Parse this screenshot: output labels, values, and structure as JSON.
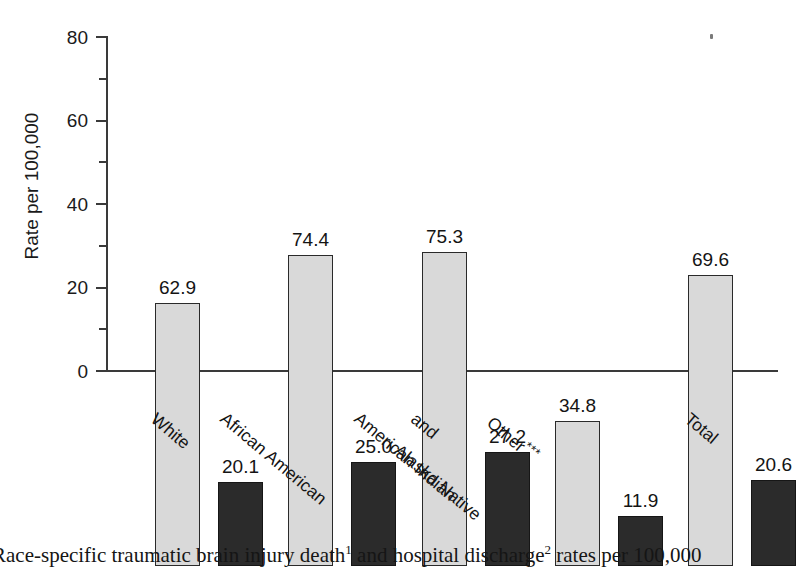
{
  "chart_data": {
    "type": "bar",
    "title": "",
    "xlabel": "",
    "ylabel": "Rate per 100,000",
    "ylim": [
      0,
      80
    ],
    "yticks": [
      0,
      20,
      40,
      60,
      80
    ],
    "yminor_ticks": [
      10,
      30,
      50,
      70
    ],
    "grid": false,
    "legend_position": "none",
    "categories": [
      "White",
      "African American",
      "American Indian\nand\nAlaska Native",
      "Other***",
      "Total"
    ],
    "category_labels": [
      {
        "line1": "White",
        "line2": "",
        "line3": "",
        "stars": ""
      },
      {
        "line1": "African American",
        "line2": "",
        "line3": "",
        "stars": ""
      },
      {
        "line1": "American Indian",
        "line2": "and",
        "line3": "Alaska Native",
        "stars": ""
      },
      {
        "line1": "Other",
        "line2": "",
        "line3": "",
        "stars": "***"
      },
      {
        "line1": "Total",
        "line2": "",
        "line3": "",
        "stars": ""
      }
    ],
    "series": [
      {
        "name": "Hospital discharge rate",
        "color": "#d9d9d9",
        "values": [
          62.9,
          74.4,
          75.3,
          34.8,
          69.6
        ],
        "labels": [
          "62.9",
          "74.4",
          "75.3",
          "34.8",
          "69.6"
        ]
      },
      {
        "name": "Death rate",
        "color": "#2b2b2b",
        "values": [
          20.1,
          25.0,
          27.2,
          11.9,
          20.6
        ],
        "labels": [
          "20.1",
          "25.0",
          "27.2",
          "11.9",
          "20.6"
        ]
      }
    ]
  },
  "axis": {
    "y_title": "Rate per 100,000",
    "tick_labels": [
      "80",
      "60",
      "40",
      "20",
      "0"
    ]
  },
  "caption": {
    "prefix": "Race-specific traumatic brain injury death",
    "sup1": "1",
    "middle": " and hospital discharge",
    "sup2": "2",
    "suffix": " rates per 100,000"
  },
  "colors": {
    "light_bar": "#d9d9d9",
    "dark_bar": "#2b2b2b",
    "axis": "#3a3a3a",
    "text": "#141414",
    "background": "#ffffff"
  }
}
